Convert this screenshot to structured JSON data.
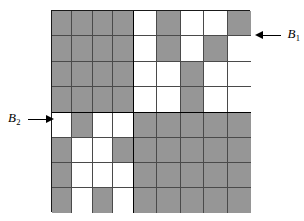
{
  "figure": {
    "kind": "block-matrix-diagram",
    "colors": {
      "shaded": "#969696",
      "unshaded": "#ffffff",
      "grid_line": "#4a4a4a",
      "partition_line": "#000000",
      "arrow": "#000000",
      "background": "#ffffff"
    },
    "grid": {
      "total_rows": 8,
      "total_columns": 9,
      "partition_row_index": 4,
      "partition_column_index": 4
    }
  },
  "labels": [
    {
      "id": "b1",
      "text": "B",
      "subscript": "1",
      "arrow_direction": "left",
      "points_to": "top-right-block"
    },
    {
      "id": "b2",
      "text": "B",
      "subscript": "2",
      "arrow_direction": "right",
      "points_to": "bottom-left-block"
    }
  ],
  "blocks": {
    "top_left": {
      "name": "A1",
      "rows": 4,
      "columns": 4,
      "cells": [
        [
          "g",
          "g",
          "g",
          "g"
        ],
        [
          "g",
          "g",
          "g",
          "g"
        ],
        [
          "g",
          "g",
          "g",
          "g"
        ],
        [
          "g",
          "g",
          "g",
          "g"
        ]
      ]
    },
    "top_right": {
      "name": "B1",
      "rows": 4,
      "columns": 5,
      "cells": [
        [
          "w",
          "g",
          "w",
          "w",
          "g"
        ],
        [
          "w",
          "g",
          "w",
          "g",
          "w"
        ],
        [
          "w",
          "w",
          "g",
          "w",
          "w"
        ],
        [
          "w",
          "w",
          "g",
          "w",
          "w"
        ]
      ]
    },
    "bottom_left": {
      "name": "B2",
      "rows": 4,
      "columns": 4,
      "cells": [
        [
          "w",
          "g",
          "w",
          "w"
        ],
        [
          "g",
          "w",
          "w",
          "g"
        ],
        [
          "g",
          "w",
          "w",
          "w"
        ],
        [
          "g",
          "w",
          "g",
          "w"
        ]
      ]
    },
    "bottom_right": {
      "name": "A2",
      "rows": 4,
      "columns": 5,
      "cells": [
        [
          "g",
          "g",
          "g",
          "g",
          "g"
        ],
        [
          "g",
          "g",
          "g",
          "g",
          "g"
        ],
        [
          "g",
          "g",
          "g",
          "g",
          "g"
        ],
        [
          "g",
          "g",
          "g",
          "g",
          "g"
        ]
      ]
    }
  }
}
